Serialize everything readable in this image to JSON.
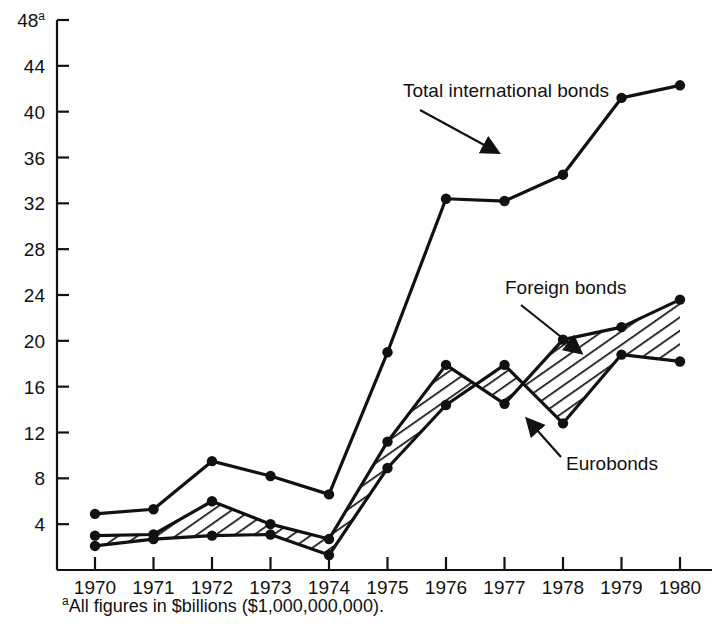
{
  "chart_data": {
    "type": "line",
    "title": "",
    "xlabel": "",
    "ylabel": "",
    "categories": [
      "1970",
      "1971",
      "1972",
      "1973",
      "1974",
      "1975",
      "1976",
      "1977",
      "1978",
      "1979",
      "1980"
    ],
    "x": [
      1970,
      1971,
      1972,
      1973,
      1974,
      1975,
      1976,
      1977,
      1978,
      1979,
      1980
    ],
    "ylim": [
      0,
      48
    ],
    "xlim": [
      1970,
      1980
    ],
    "ytick_values": [
      4,
      8,
      12,
      16,
      20,
      24,
      28,
      32,
      36,
      40,
      44,
      48
    ],
    "ytick_labels": [
      "4",
      "8",
      "12",
      "16",
      "20",
      "24",
      "28",
      "32",
      "36",
      "40",
      "44",
      "48"
    ],
    "ytop_superscript": "a",
    "grid": false,
    "legend_position": "inline-annotations",
    "series": [
      {
        "name": "Total international bonds",
        "values": [
          4.9,
          5.3,
          9.5,
          8.2,
          6.6,
          19.0,
          32.4,
          32.2,
          34.5,
          41.2,
          42.3
        ]
      },
      {
        "name": "Foreign bonds",
        "values": [
          3.0,
          3.1,
          6.0,
          4.0,
          2.7,
          11.2,
          17.9,
          14.5,
          20.1,
          21.2,
          23.6
        ]
      },
      {
        "name": "Eurobonds",
        "values": [
          2.1,
          2.7,
          3.0,
          3.1,
          1.3,
          8.9,
          14.4,
          17.9,
          12.8,
          18.8,
          18.2
        ]
      }
    ],
    "shaded_region": {
      "label": "Eurobonds",
      "pattern": "diagonal-hatch",
      "between_series": [
        "Foreign bonds",
        "Eurobonds"
      ]
    },
    "annotations": [
      {
        "text": "Total international bonds",
        "x": 403,
        "y": 97,
        "arrow_from": [
          420,
          110
        ],
        "arrow_to": [
          497,
          152
        ]
      },
      {
        "text": "Foreign bonds",
        "x": 505,
        "y": 294,
        "arrow_from": [
          521,
          305
        ],
        "arrow_to": [
          580,
          352
        ]
      },
      {
        "text": "Eurobonds",
        "x": 566,
        "y": 470,
        "arrow_from": [
          561,
          457
        ],
        "arrow_to": [
          528,
          420
        ]
      }
    ],
    "footnote": "All figures in $billions ($1,000,000,000).",
    "footnote_marker": "a",
    "colors": {
      "line": "#111111",
      "background": "#ffffff",
      "text": "#111111"
    }
  }
}
